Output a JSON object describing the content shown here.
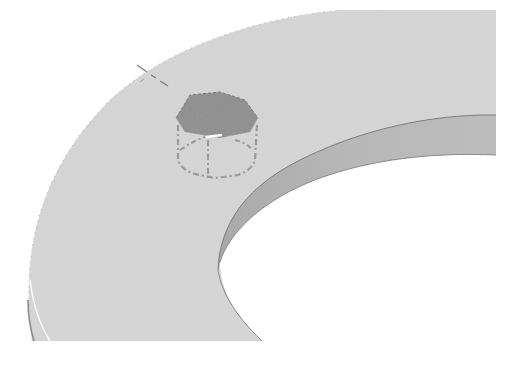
{
  "viewport": {
    "description": "3D CAD graphics area showing a ring (washer) part viewed isometrically with a hexagonal boss feature being placed on the top face",
    "background_color": "#ffffff"
  },
  "model": {
    "part": "ring",
    "top_face_color": "#d6d6d6",
    "inner_wall_color": "#b4b4b4",
    "edge_color": "#7c7c7c",
    "hole_color": "#ffffff"
  },
  "feature": {
    "type": "hexagonal-boss-preview",
    "top_face_color": "#8f8f8f",
    "preview_line_color": "#9a9a9a",
    "preview_line_style": "dash-dot"
  },
  "annotation": {
    "arrow_color": "#1a1a1a",
    "arrow_direction": "pointing-down-left toward hex feature"
  },
  "cursor": {
    "type": "pointer-with-plus",
    "state": "add"
  },
  "labels": {
    "viewport_label": "Graphics area",
    "feature_label": "Hex boss preview",
    "arrow_label": "Callout arrow",
    "cursor_label": "Add cursor"
  }
}
